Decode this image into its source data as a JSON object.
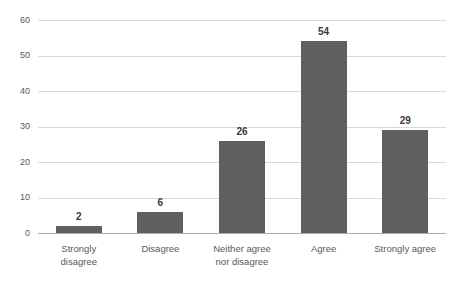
{
  "chart_data": {
    "type": "bar",
    "title": "",
    "xlabel": "",
    "ylabel": "",
    "categories": [
      "Strongly disagree",
      "Disagree",
      "Neither agree nor disagree",
      "Agree",
      "Strongly agree"
    ],
    "values": [
      2,
      6,
      26,
      54,
      29
    ],
    "data_labels": [
      2,
      6,
      26,
      54,
      29
    ],
    "ylim": [
      0,
      60
    ],
    "yticks": [
      0,
      10,
      20,
      30,
      40,
      50,
      60
    ],
    "grid": true,
    "legend": "none",
    "colors": {
      "bar_fill": "#5f5f5f",
      "gridline": "#d9d9d9",
      "axis_line": "#ababab",
      "tick_label_text": "#595959",
      "category_label_text": "#595959",
      "data_label_text": "#3a3a3a",
      "background": "#ffffff"
    }
  }
}
